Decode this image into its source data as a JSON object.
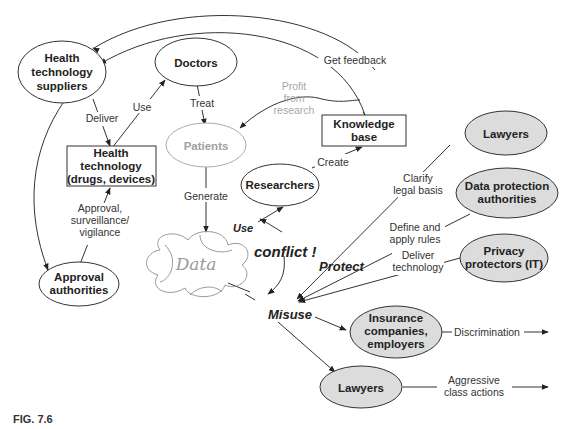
{
  "figure": {
    "label": "FIG. 7.6"
  },
  "nodes": {
    "health_tech_suppliers": [
      "Health",
      "technology",
      "suppliers"
    ],
    "doctors": "Doctors",
    "patients": "Patients",
    "health_technology": [
      "Health",
      "technology",
      "(drugs, devices)"
    ],
    "approval_authorities": [
      "Approval",
      "authorities"
    ],
    "knowledge_base": [
      "Knowledge",
      "base"
    ],
    "researchers": "Researchers",
    "data": "Data",
    "lawyers_protect": "Lawyers",
    "data_protection_authorities": [
      "Data protection",
      "authorities"
    ],
    "privacy_protectors": [
      "Privacy",
      "protectors (IT)"
    ],
    "insurance": [
      "Insurance",
      "companies,",
      "employers"
    ],
    "lawyers_misuse": "Lawyers"
  },
  "edges": {
    "get_feedback": "Get feedback",
    "profit_from_research": [
      "Profit",
      "from",
      "research"
    ],
    "use_doctors": "Use",
    "deliver": "Deliver",
    "treat": "Treat",
    "create": "Create",
    "generate": "Generate",
    "approval": [
      "Approval,",
      "surveillance/",
      "vigilance"
    ],
    "use_data": "Use",
    "conflict": "conflict !",
    "protect": "Protect",
    "misuse": "Misuse",
    "clarify": [
      "Clarify",
      "legal basis"
    ],
    "define": [
      "Define and",
      "apply rules"
    ],
    "deliver_tech": [
      "Deliver",
      "technology"
    ],
    "discrimination": "Discrimination",
    "aggressive": [
      "Aggressive",
      "class actions"
    ]
  },
  "colors": {
    "line": "#333333",
    "fill_gray": "#d9d9d9",
    "muted": "#a0a0a0"
  }
}
